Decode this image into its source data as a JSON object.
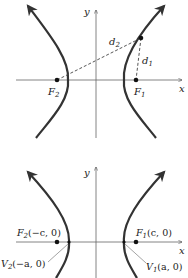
{
  "colors": {
    "curve": "#333333",
    "axis": "#555555",
    "dash": "#444444",
    "text": "#222222"
  },
  "top_diagram": {
    "axis_x_label": "x",
    "axis_y_label": "y",
    "focus_left_label": "F",
    "focus_left_sub": "2",
    "focus_right_label": "F",
    "focus_right_sub": "1",
    "d2_label": "d",
    "d2_sub": "2",
    "d1_label": "d",
    "d1_sub": "1"
  },
  "bottom_diagram": {
    "axis_x_label": "x",
    "axis_y_label": "y",
    "focus_left_label": "F",
    "focus_left_sub": "2",
    "focus_left_coords": "(−c, 0)",
    "focus_right_label": "F",
    "focus_right_sub": "1",
    "focus_right_coords": "(c, 0)",
    "vertex_left_label": "V",
    "vertex_left_sub": "2",
    "vertex_left_coords": "(−a, 0)",
    "vertex_right_label": "V",
    "vertex_right_sub": "1",
    "vertex_right_coords": "(a, 0)"
  }
}
